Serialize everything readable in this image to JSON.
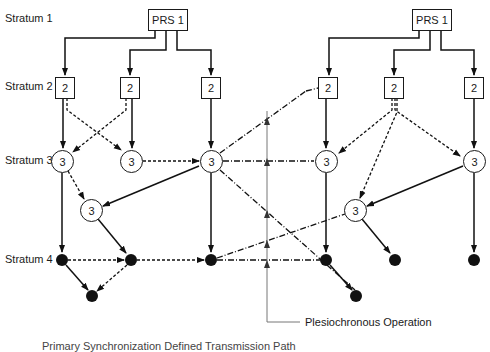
{
  "diagram": {
    "strata": [
      {
        "label": "Stratum 1"
      },
      {
        "label": "Stratum 2"
      },
      {
        "label": "Stratum 3"
      },
      {
        "label": "Stratum 4"
      }
    ],
    "prs_nodes": [
      {
        "label": "PRS 1"
      },
      {
        "label": "PRS 1"
      }
    ],
    "stratum2_nodes": [
      {
        "label": "2"
      },
      {
        "label": "2"
      },
      {
        "label": "2"
      },
      {
        "label": "2"
      },
      {
        "label": "2"
      },
      {
        "label": "2"
      }
    ],
    "stratum3_nodes": [
      {
        "label": "3"
      },
      {
        "label": "3"
      },
      {
        "label": "3"
      },
      {
        "label": "3"
      },
      {
        "label": "3"
      },
      {
        "label": "3"
      },
      {
        "label": "3"
      },
      {
        "label": "3"
      }
    ],
    "annotation": "Plesiochronous Operation",
    "footer_clipped": "Primary Synchronization Defined Transmission Path"
  }
}
